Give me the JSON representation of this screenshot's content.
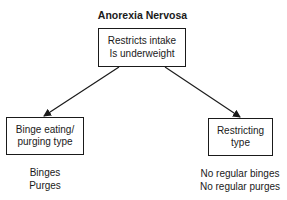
{
  "diagram": {
    "title": "Anorexia Nervosa",
    "root": {
      "lines": [
        "Restricts intake",
        "Is underweight"
      ]
    },
    "branches": [
      {
        "lines": [
          "Binge eating/",
          "purging type"
        ],
        "features": [
          "Binges",
          "Purges"
        ]
      },
      {
        "lines": [
          "Restricting",
          "type"
        ],
        "features": [
          "No regular binges",
          "No regular purges"
        ]
      }
    ],
    "edges": [
      {
        "from": "root",
        "to": "branches.0"
      },
      {
        "from": "root",
        "to": "branches.1"
      }
    ],
    "colors": {
      "line": "#1a1a1a",
      "background": "#ffffff"
    }
  }
}
